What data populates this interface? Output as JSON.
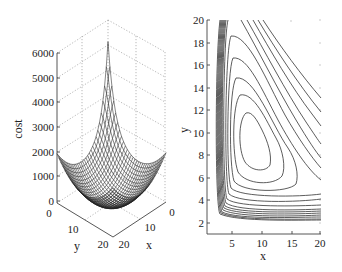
{
  "chart_data": [
    {
      "type": "surface3d",
      "title": "",
      "zlabel": "cost",
      "xlabel": "x",
      "ylabel": "y",
      "z_ticks": [
        "0",
        "1000",
        "2000",
        "3000",
        "4000",
        "5000",
        "6000"
      ],
      "x_ticks": [
        "0",
        "10",
        "20"
      ],
      "y_ticks": [
        "0",
        "10",
        "20"
      ],
      "zlim": [
        0,
        6000
      ],
      "xlim": [
        0,
        20
      ],
      "ylim": [
        0,
        20
      ],
      "grid": true,
      "description": "Bowl-shaped cost mesh surface; minimum near (x≈10, y≈10) close to 0, edges rising to ~2000, sharp peak at the back corner (x=0, y=0) reaching ~5200."
    },
    {
      "type": "contour",
      "title": "",
      "xlabel": "x",
      "ylabel": "y",
      "x_ticks": [
        "5",
        "10",
        "15",
        "20"
      ],
      "y_ticks": [
        "2",
        "4",
        "6",
        "8",
        "10",
        "12",
        "14",
        "16",
        "18",
        "20"
      ],
      "xlim": [
        1,
        20
      ],
      "ylim": [
        1,
        20
      ],
      "grid": false,
      "minimum_approx": {
        "x": 10,
        "y": 9
      },
      "description": "Nested contours around a minimum near (10, 9); dense contour band along x≈3–4 and y≈3–4, open contours extending toward upper right."
    }
  ],
  "left": {
    "zlabel": "cost",
    "xlabel": "x",
    "ylabel": "y",
    "z_ticks": [
      "0",
      "1000",
      "2000",
      "3000",
      "4000",
      "5000",
      "6000"
    ],
    "x_ticks": [
      "0",
      "10",
      "20"
    ],
    "y_ticks": [
      "0",
      "10",
      "20"
    ]
  },
  "right": {
    "xlabel": "x",
    "ylabel": "y",
    "x_ticks": [
      "5",
      "10",
      "15",
      "20"
    ],
    "y_ticks": [
      "2",
      "4",
      "6",
      "8",
      "10",
      "12",
      "14",
      "16",
      "18",
      "20"
    ]
  }
}
